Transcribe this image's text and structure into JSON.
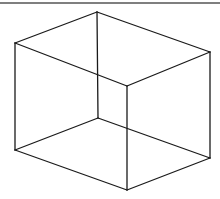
{
  "diagram": {
    "type": "wireframe-box",
    "stroke_color": "#1a1a1a",
    "border_color": "#555555",
    "background": "#ffffff",
    "top_border": {
      "x1": 0,
      "y1": 3,
      "x2": 220,
      "y2": 3
    },
    "vertices": {
      "top_back": [
        97,
        12
      ],
      "top_left": [
        15,
        43
      ],
      "top_right": [
        210,
        52
      ],
      "top_front": [
        127,
        86
      ],
      "bottom_back": [
        98,
        118
      ],
      "bottom_left": [
        15,
        150
      ],
      "bottom_right": [
        210,
        158
      ],
      "bottom_front": [
        127,
        190
      ]
    },
    "edges": [
      [
        "top_back",
        "top_left"
      ],
      [
        "top_back",
        "top_right"
      ],
      [
        "top_left",
        "top_front"
      ],
      [
        "top_right",
        "top_front"
      ],
      [
        "top_left",
        "bottom_left"
      ],
      [
        "top_right",
        "bottom_right"
      ],
      [
        "top_front",
        "bottom_front"
      ],
      [
        "top_back",
        "bottom_back"
      ],
      [
        "bottom_back",
        "bottom_left"
      ],
      [
        "bottom_back",
        "bottom_right"
      ],
      [
        "bottom_left",
        "bottom_front"
      ],
      [
        "bottom_right",
        "bottom_front"
      ]
    ]
  }
}
